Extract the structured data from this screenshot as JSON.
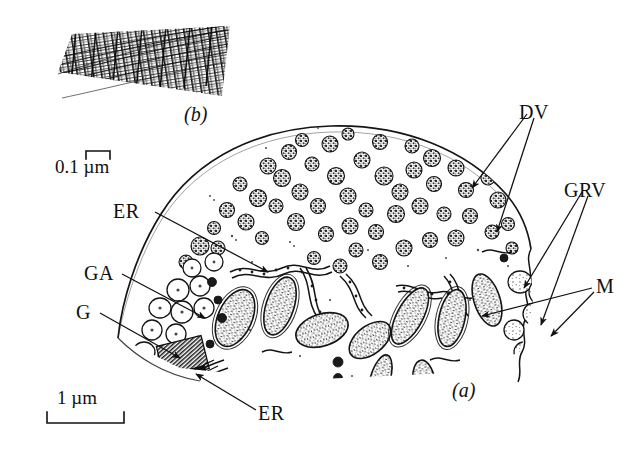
{
  "figure": {
    "kind": "electron-micrograph-tracing",
    "background_color": "#ffffff",
    "ink_color": "#1a1a1a",
    "panels": [
      {
        "id": "a",
        "caption": "(a)",
        "description": "apical cytoplasm of secretory cell"
      },
      {
        "id": "b",
        "caption": "(b)",
        "description": "striated filament bundle inset"
      }
    ]
  },
  "panel_a": {
    "caption": "(a)",
    "labels": [
      {
        "key": "DV",
        "text": "DV",
        "meaning": "dense vesicles",
        "side": "right"
      },
      {
        "key": "GRV",
        "text": "GRV",
        "meaning": "granular vesicles",
        "side": "right"
      },
      {
        "key": "M",
        "text": "M",
        "meaning": "mitochondria",
        "side": "right"
      },
      {
        "key": "ER1",
        "text": "ER",
        "meaning": "endoplasmic reticulum",
        "side": "left"
      },
      {
        "key": "GA",
        "text": "GA",
        "meaning": "Golgi apparatus",
        "side": "left"
      },
      {
        "key": "G",
        "text": "G",
        "meaning": "Golgi stack",
        "side": "left"
      },
      {
        "key": "ER2",
        "text": "ER",
        "meaning": "endoplasmic reticulum",
        "side": "bottom"
      }
    ]
  },
  "panel_b": {
    "caption": "(b)"
  },
  "scale_bars": [
    {
      "key": "upper",
      "value": "0.1",
      "unit": "µm",
      "text": "0.1 µm",
      "bracket": "up"
    },
    {
      "key": "lower",
      "value": "1",
      "unit": "µm",
      "text": "1 µm",
      "bracket": "down"
    }
  ]
}
